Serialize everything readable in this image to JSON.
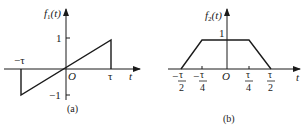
{
  "figure_a": {
    "caption": "(a)",
    "ylabel": "f1(t)",
    "ylabel_main": "f",
    "ylabel_sub": "1",
    "ylabel_arg": "(t)",
    "xlabel": "t",
    "origin": "O",
    "y_ticks": [
      "1",
      "−1"
    ],
    "x_ticks": [
      "−τ",
      "τ"
    ],
    "description": "Sawtooth: f1(t) = t/τ for −τ < t < τ, 0 otherwise"
  },
  "figure_b": {
    "caption": "(b)",
    "ylabel": "f2(t)",
    "ylabel_main": "f",
    "ylabel_sub": "2",
    "ylabel_arg": "(t)",
    "xlabel": "t",
    "origin": "O",
    "y_ticks": [
      "1"
    ],
    "x_ticks": [
      {
        "sign": "−",
        "num": "τ",
        "den": "2"
      },
      {
        "sign": "−",
        "num": "τ",
        "den": "4"
      },
      {
        "sign": "",
        "num": "τ",
        "den": "4"
      },
      {
        "sign": "",
        "num": "τ",
        "den": "2"
      }
    ],
    "description": "Trapezoid: rises from −τ/2 to −τ/4, flat at 1 until τ/4, falls to 0 at τ/2"
  },
  "colors": {
    "line": "#1a1a1a",
    "background": "#ffffff"
  }
}
